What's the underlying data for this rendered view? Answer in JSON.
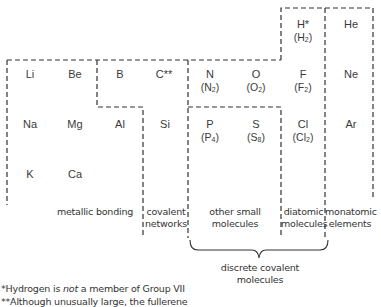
{
  "elements": [
    {
      "symbol": "Li",
      "x": 8,
      "y": 68
    },
    {
      "symbol": "Be",
      "x": 53,
      "y": 68
    },
    {
      "symbol": "B",
      "x": 98,
      "y": 68
    },
    {
      "symbol": "C**",
      "x": 142,
      "y": 68
    },
    {
      "symbol": "N",
      "formula": "N",
      "sub": "2",
      "x": 188,
      "y": 68
    },
    {
      "symbol": "O",
      "formula": "O",
      "sub": "2",
      "x": 234,
      "y": 68
    },
    {
      "symbol": "F",
      "formula": "F",
      "sub": "2",
      "x": 281,
      "y": 68
    },
    {
      "symbol": "H*",
      "formula": "H",
      "sub": "2",
      "x": 281,
      "y": 18
    },
    {
      "symbol": "He",
      "x": 329,
      "y": 18
    },
    {
      "symbol": "Ne",
      "x": 329,
      "y": 68
    },
    {
      "symbol": "Na",
      "x": 8,
      "y": 118
    },
    {
      "symbol": "Mg",
      "x": 53,
      "y": 118
    },
    {
      "symbol": "Al",
      "x": 98,
      "y": 118
    },
    {
      "symbol": "Si",
      "x": 143,
      "y": 118
    },
    {
      "symbol": "P",
      "formula": "P",
      "sub": "4",
      "x": 188,
      "y": 118
    },
    {
      "symbol": "S",
      "formula": "S",
      "sub": "8",
      "x": 234,
      "y": 118
    },
    {
      "symbol": "Cl",
      "formula": "Cl",
      "sub": "2",
      "x": 281,
      "y": 118
    },
    {
      "symbol": "Ar",
      "x": 329,
      "y": 118
    },
    {
      "symbol": "K",
      "x": 8,
      "y": 168
    },
    {
      "symbol": "Ca",
      "x": 53,
      "y": 168
    }
  ],
  "labels": {
    "metallic": "metallic bonding",
    "covalent_1": "covalent",
    "covalent_2": "networks",
    "other_1": "other small",
    "other_2": "molecules",
    "diatomic_1": "diatomic",
    "diatomic_2": "molecules",
    "monatomic_1": "monatomic",
    "monatomic_2": "elements",
    "discrete_1": "discrete covalent",
    "discrete_2": "molecules"
  },
  "footnotes": {
    "note1_pre": "*Hydrogen is ",
    "note1_em": "not",
    "note1_post": " a member of Group VII",
    "note2": "**Although unusually large, the fullerene"
  }
}
